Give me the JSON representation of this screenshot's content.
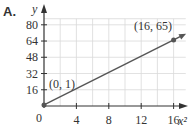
{
  "panel_label": "A.",
  "chart_data": {
    "type": "line",
    "title": "",
    "xlabel": "x²",
    "ylabel": "y",
    "xlim": [
      0,
      17.5
    ],
    "ylim": [
      0,
      86
    ],
    "x_ticks": [
      4,
      8,
      12,
      16
    ],
    "y_ticks": [
      16,
      32,
      48,
      64,
      80
    ],
    "origin_label": "0",
    "grid": true,
    "x_grid_step": 2,
    "y_grid_step": 16,
    "series": [
      {
        "name": "line",
        "x": [
          0,
          16
        ],
        "y": [
          1,
          65
        ],
        "extends_arrow": true
      }
    ],
    "annotations": [
      {
        "text": "(0, 1)",
        "x": 0,
        "y": 1
      },
      {
        "text": "(16, 65)",
        "x": 16,
        "y": 65
      }
    ]
  }
}
